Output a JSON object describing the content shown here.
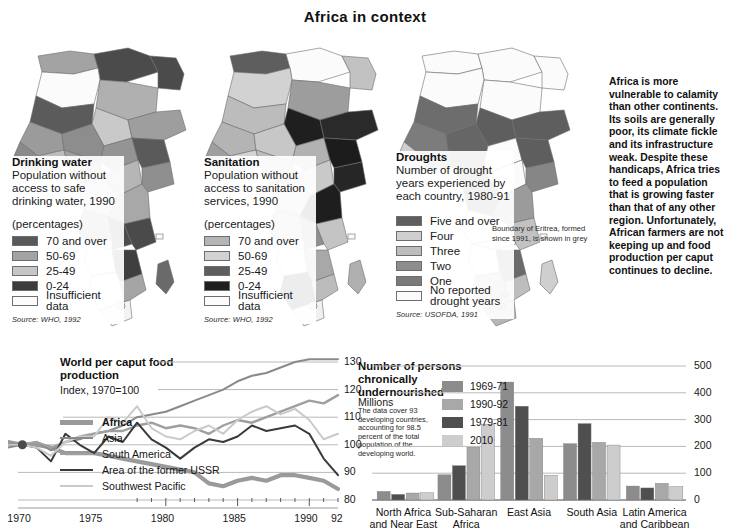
{
  "title": "Africa in context",
  "colors": {
    "dark": "#4a4a4a",
    "mid": "#8f8f8f",
    "light": "#bdbdbd",
    "near_black": "#2b2b2b",
    "white": "#fdfdfd",
    "pale": "#d6d6d6",
    "grid": "#b9b9b9",
    "text": "#1a1a1a"
  },
  "maps": [
    {
      "id": "drinking-water",
      "title": "Drinking water",
      "subtitle": "Population without access to safe drinking water, 1990",
      "unit": "(percentages)",
      "legend": [
        {
          "label": "70 and over",
          "color": "#595959"
        },
        {
          "label": "50-69",
          "color": "#a3a3a3"
        },
        {
          "label": "25-49",
          "color": "#c6c6c6"
        },
        {
          "label": "0-24",
          "color": "#3c3c3c"
        },
        {
          "label": "Insufficient data",
          "color": "#fbfbfb"
        }
      ],
      "source": "Source: WHO, 1992"
    },
    {
      "id": "sanitation",
      "title": "Sanitation",
      "subtitle": "Population without access to sanitation services, 1990",
      "unit": "(percentages)",
      "legend": [
        {
          "label": "70 and over",
          "color": "#b5b5b5"
        },
        {
          "label": "50-69",
          "color": "#d2d2d2"
        },
        {
          "label": "25-49",
          "color": "#5e5e5e"
        },
        {
          "label": "0-24",
          "color": "#1f1f1f"
        },
        {
          "label": "Insufficient data",
          "color": "#fbfbfb"
        }
      ],
      "source": "Source: WHO, 1992"
    },
    {
      "id": "droughts",
      "title": "Droughts",
      "subtitle": "Number of drought years experienced by each country, 1980-91",
      "unit": "",
      "legend": [
        {
          "label": "Five and over",
          "color": "#5e5e5e"
        },
        {
          "label": "Four",
          "color": "#cfcfcf"
        },
        {
          "label": "Three",
          "color": "#bdbdbd"
        },
        {
          "label": "Two",
          "color": "#8d8d8d"
        },
        {
          "label": "One",
          "color": "#7a7a7a"
        },
        {
          "label": "No reported drought years",
          "color": "#fbfbfb"
        }
      ],
      "note": "Boundary of Eritrea, formed since 1991, is shown in grey",
      "source": "Source: USOFDA, 1991"
    }
  ],
  "commentary": "Africa is more vulnerable to calamity than other continents. Its soils are generally poor, its climate fickle and its infrastructure weak. Despite these handicaps, Africa tries to feed a population that is growing faster than that of any other region. Unfortunately, African farmers are not keeping up and food production per caput continues to decline.",
  "chart_data": [
    {
      "id": "world-food-production",
      "type": "line",
      "title": "World per caput food production",
      "subtitle": "Index, 1970=100",
      "xlabel": "",
      "ylabel": "",
      "ylim": [
        80,
        130
      ],
      "yticks": [
        130,
        120,
        110,
        100,
        90,
        80
      ],
      "xlim": [
        1969,
        1992
      ],
      "xticks": [
        1970,
        1975,
        1980,
        1985,
        1990
      ],
      "xticklabels": [
        "1970",
        "1975",
        "1980",
        "1985",
        "1990",
        "92"
      ],
      "grid": true,
      "legend_position": "left",
      "x": [
        1969,
        1970,
        1971,
        1972,
        1973,
        1974,
        1975,
        1976,
        1977,
        1978,
        1979,
        1980,
        1981,
        1982,
        1983,
        1984,
        1985,
        1986,
        1987,
        1988,
        1989,
        1990,
        1991,
        1992
      ],
      "series": [
        {
          "name": "Africa",
          "color": "#9a9a9a",
          "width": 4.2,
          "bold": true,
          "values": [
            101,
            100,
            100,
            99,
            97,
            97,
            97,
            96,
            95,
            94,
            93,
            92,
            91,
            90,
            86,
            85,
            87,
            88,
            87,
            89,
            89,
            88,
            87,
            84
          ]
        },
        {
          "name": "Asia",
          "color": "#8a8a8a",
          "width": 2.0,
          "bold": false,
          "values": [
            99,
            100,
            101,
            98,
            101,
            102,
            104,
            105,
            107,
            110,
            111,
            112,
            114,
            116,
            118,
            120,
            123,
            125,
            126,
            128,
            130,
            131,
            131,
            131
          ]
        },
        {
          "name": "South America",
          "color": "#9f9f9f",
          "width": 2.4,
          "bold": false,
          "values": [
            100,
            100,
            101,
            99,
            101,
            103,
            104,
            105,
            105,
            107,
            108,
            106,
            107,
            106,
            104,
            107,
            109,
            108,
            110,
            112,
            114,
            116,
            115,
            118
          ]
        },
        {
          "name": "Area of the former USSR",
          "color": "#3a3a3a",
          "width": 2.0,
          "bold": false,
          "values": [
            100,
            100,
            99,
            94,
            104,
            100,
            97,
            103,
            101,
            108,
            102,
            99,
            95,
            99,
            102,
            101,
            103,
            107,
            105,
            106,
            107,
            104,
            95,
            89
          ]
        },
        {
          "name": "Southwest Pacific",
          "color": "#cacaca",
          "width": 2.0,
          "bold": false,
          "values": [
            100,
            100,
            99,
            96,
            101,
            103,
            103,
            110,
            108,
            114,
            106,
            103,
            102,
            105,
            107,
            104,
            109,
            112,
            114,
            111,
            113,
            109,
            102,
            104
          ]
        }
      ]
    },
    {
      "id": "chronically-undernourished",
      "type": "bar",
      "title": "Number of persons chronically undernourished",
      "subtitle": "Millions",
      "caption": "The data cover 93 developing countries, accounting for 98.5 percent of the total population of the developing world.",
      "xlabel": "",
      "ylabel": "",
      "ylim": [
        0,
        500
      ],
      "yticks": [
        500,
        400,
        300,
        200,
        100,
        0
      ],
      "grid": true,
      "legend_position": "top-right",
      "categories": [
        "North Africa and Near East",
        "Sub-Saharan Africa",
        "East Asia",
        "South Asia",
        "Latin America and Caribbean"
      ],
      "series": [
        {
          "name": "1969-71",
          "color": "#8c8c8c",
          "values": [
            32,
            94,
            440,
            210,
            52
          ]
        },
        {
          "name": "1979-81",
          "color": "#4f4f4f",
          "values": [
            21,
            128,
            350,
            285,
            45
          ]
        },
        {
          "name": "1990-92",
          "color": "#a8a8a8",
          "values": [
            26,
            197,
            230,
            215,
            62
          ]
        },
        {
          "name": "2010",
          "color": "#cdcdcd",
          "values": [
            27,
            283,
            92,
            205,
            50
          ]
        }
      ]
    }
  ]
}
